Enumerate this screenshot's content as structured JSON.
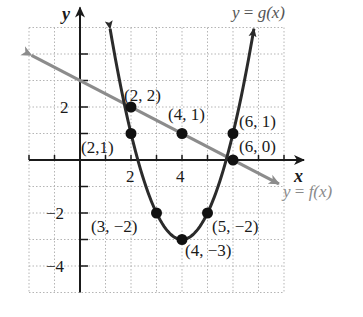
{
  "chart_data": {
    "type": "line",
    "title": "",
    "xlabel": "x",
    "ylabel": "y",
    "xlim": [
      -2,
      8
    ],
    "ylim": [
      -5,
      5
    ],
    "grid": true,
    "x_ticks": [
      2,
      4
    ],
    "y_ticks": [
      2,
      -2,
      -4
    ],
    "x_tick_labels": [
      "2",
      "4"
    ],
    "y_tick_labels": [
      "2",
      "−2",
      "−4"
    ],
    "series": [
      {
        "name": "y = f(x)",
        "label_parts": {
          "y": "y",
          "eq": " = ",
          "fn": "f(x)"
        },
        "formula": "f(x) = -x/2 + 3",
        "kind": "linear",
        "slope": -0.5,
        "intercept": 3,
        "domain": [
          -1.9,
          7.8
        ],
        "color": "#8c8c8c"
      },
      {
        "name": "y = g(x)",
        "label_parts": {
          "y": "y",
          "eq": " = ",
          "fn": "g(x)"
        },
        "formula": "g(x) = (x - 4)^2 - 3",
        "kind": "quadratic",
        "vertex": [
          4,
          -3
        ],
        "a": 1,
        "domain": [
          1.18,
          6.82
        ],
        "color": "#2b2b2b"
      }
    ],
    "points": [
      {
        "x": 2,
        "y": 2,
        "label": "(2, 2)"
      },
      {
        "x": 2,
        "y": 1,
        "label": "(2,1)"
      },
      {
        "x": 4,
        "y": 1,
        "label": "(4, 1)"
      },
      {
        "x": 6,
        "y": 1,
        "label": "(6, 1)"
      },
      {
        "x": 6,
        "y": 0,
        "label": "(6, 0)"
      },
      {
        "x": 3,
        "y": -2,
        "label": "(3, −2)"
      },
      {
        "x": 5,
        "y": -2,
        "label": "(5, −2)"
      },
      {
        "x": 4,
        "y": -3,
        "label": "(4, −3)"
      }
    ]
  }
}
